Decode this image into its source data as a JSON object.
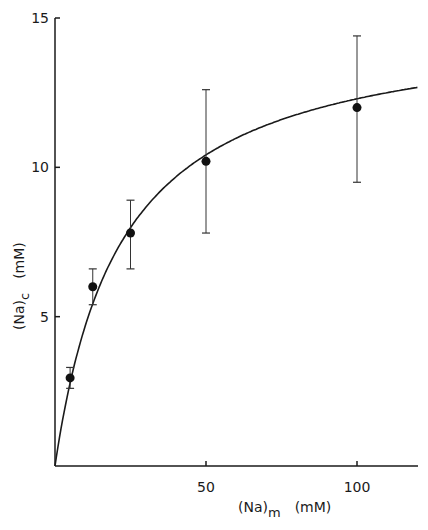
{
  "chart_data": {
    "type": "scatter",
    "title": "",
    "xlabel": "(Na)m (mM)",
    "xlabel_main": "(Na)",
    "xlabel_sub": "m",
    "xlabel_unit": "(mM)",
    "ylabel": "(Na)c (mM)",
    "ylabel_main": "(Na)",
    "ylabel_sub": "c",
    "ylabel_unit": "(mM)",
    "xlim": [
      0,
      120
    ],
    "ylim": [
      0,
      15
    ],
    "x_ticks": [
      50,
      100
    ],
    "x_tick_labels": [
      "50",
      "100"
    ],
    "y_ticks": [
      5,
      10,
      15
    ],
    "y_tick_labels": [
      "5",
      "10",
      "15"
    ],
    "grid": false,
    "legend": null,
    "series": [
      {
        "name": "measured",
        "x": [
          5,
          12.5,
          25,
          50,
          100
        ],
        "y": [
          2.95,
          6.0,
          7.8,
          10.2,
          12.0
        ],
        "err_low": [
          2.6,
          5.4,
          6.6,
          7.8,
          9.5
        ],
        "err_high": [
          3.3,
          6.6,
          8.9,
          12.6,
          14.4
        ]
      },
      {
        "name": "fitted curve",
        "type": "line",
        "model": "y = 15x/(x+22)",
        "x": [
          0,
          5,
          12.5,
          25,
          50,
          75,
          100,
          120
        ],
        "y": [
          0,
          2.8,
          5.4,
          8.0,
          10.4,
          11.6,
          12.3,
          12.7
        ]
      }
    ]
  }
}
